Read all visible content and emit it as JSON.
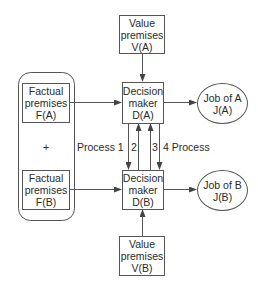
{
  "diagram": {
    "value_a": {
      "lines": [
        "Value",
        "premises",
        "V(A)"
      ]
    },
    "value_b": {
      "lines": [
        "Value",
        "premises",
        "V(B)"
      ]
    },
    "decision_a": {
      "lines": [
        "Decision",
        "maker",
        "D(A)"
      ]
    },
    "decision_b": {
      "lines": [
        "Decision",
        "maker",
        "D(B)"
      ]
    },
    "factual_a": {
      "lines": [
        "Factual",
        "premises",
        "F(A)"
      ]
    },
    "factual_b": {
      "lines": [
        "Factual",
        "premises",
        "F(B)"
      ]
    },
    "job_a": {
      "lines": [
        "Job of A",
        "J(A)"
      ]
    },
    "job_b": {
      "lines": [
        "Job of B",
        "J(B)"
      ]
    },
    "plus": "+",
    "process_left": "Process 1",
    "num_2": "2",
    "num_3": "3",
    "process_right": "4  Process",
    "colors": {
      "stroke": "#555555",
      "text": "#2a2a2a",
      "background": "#ffffff"
    }
  }
}
